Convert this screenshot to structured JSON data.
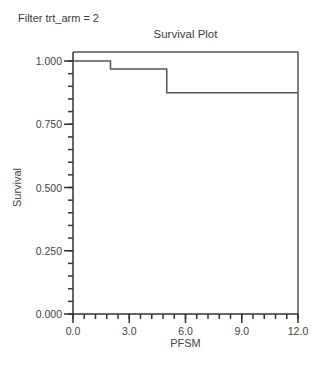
{
  "filter_label": "Filter trt_arm = 2",
  "chart_data": {
    "type": "line",
    "subtype": "step",
    "title": "Survival Plot",
    "xlabel": "PFSM",
    "ylabel": "Survival",
    "xlim": [
      0,
      12
    ],
    "ylim": [
      0,
      1
    ],
    "x_ticks": [
      0,
      3,
      6,
      9,
      12
    ],
    "x_tick_labels": [
      "0.0",
      "3.0",
      "6.0",
      "9.0",
      "12.0"
    ],
    "x_minor_step": 0.6,
    "y_ticks": [
      0,
      0.25,
      0.5,
      0.75,
      1.0
    ],
    "y_tick_labels": [
      "0.000",
      "0.250",
      "0.500",
      "0.750",
      "1.000"
    ],
    "y_minor_step": 0.05,
    "grid": false,
    "legend": null,
    "series": [
      {
        "name": "Survival",
        "x": [
          0,
          2.0,
          2.0,
          5.0,
          5.0,
          12.0
        ],
        "y": [
          1.0,
          1.0,
          0.968,
          0.968,
          0.875,
          0.875
        ]
      }
    ]
  },
  "colors": {
    "line": "#555555",
    "axis": "#333333",
    "text": "#444444"
  }
}
